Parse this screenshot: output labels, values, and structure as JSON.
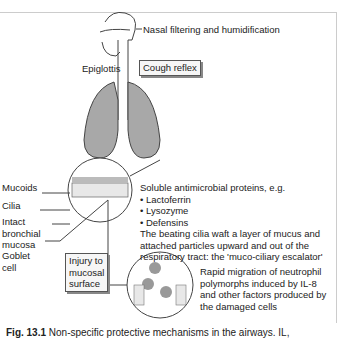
{
  "labels": {
    "nasal": "Nasal filtering and humidification",
    "epiglottis": "Epiglottis",
    "cough": "Cough reflex",
    "mucoids": "Mucoids",
    "cilia": "Cilia",
    "intact": "Intact",
    "bronchial": "bronchial",
    "mucosa": "mucosa",
    "goblet": "Goblet",
    "cell": "cell",
    "injury1": "Injury to",
    "injury2": "mucosal",
    "injury3": "surface"
  },
  "proteins": {
    "heading": "Soluble antimicrobial proteins, e.g.",
    "items": [
      "• Lactoferrin",
      "• Lysozyme",
      "• Defensins"
    ],
    "escalator1": "The beating cilia waft a layer of mucus and",
    "escalator2": "attached particles upward and out of the",
    "escalator3": "respiratory tract: the 'muco-ciliary escalator'"
  },
  "neutrophil": {
    "line1": "Rapid migration of neutrophil",
    "line2": "polymorphs induced by IL-8",
    "line3": "and other factors produced by",
    "line4": "the damaged cells"
  },
  "caption": {
    "fig": "Fig. 13.1",
    "text": " Non-specific protective mechanisms in the airways. IL,"
  },
  "colors": {
    "lung": "#a8a8a8",
    "line": "#444444",
    "box": "#f6f6f6"
  }
}
